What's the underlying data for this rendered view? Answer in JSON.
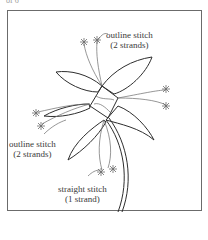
{
  "page_label": "of 6",
  "diagram": {
    "labels": [
      {
        "id": "top",
        "line1": "outline stitch",
        "line2": "(2 strands)"
      },
      {
        "id": "left",
        "line1": "outline stitch",
        "line2": "(2 strands)"
      },
      {
        "id": "bottom",
        "line1": "straight stitch",
        "line2": "(1 strand)"
      }
    ]
  },
  "colors": {
    "line": "#2e2e2e",
    "thread": "#6a6a6a",
    "frame": "#6b6b6b",
    "text": "#3a3a3a"
  }
}
